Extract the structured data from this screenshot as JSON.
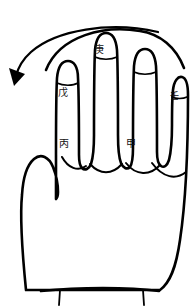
{
  "figure": {
    "background_color": "#ffffff",
    "line_color": "#000000",
    "text_color": "#111111",
    "orientation": "back of left hand, fingers up"
  },
  "labels": {
    "index_finger": "戊",
    "middle_finger": "庚",
    "pinky_finger": "壬",
    "palm_index_base": "丙",
    "palm_ring_base": "甲"
  },
  "annotations": {
    "arrow": {
      "name": "counterclockwise-direction-arrow",
      "direction": "right-to-left curving down, arrowhead at lower-left"
    }
  },
  "parts": {
    "thumb": "thumb",
    "index": "index-finger",
    "middle": "middle-finger",
    "ring": "ring-finger",
    "pinky": "pinky-finger",
    "palm": "palm",
    "wrist": "wrist"
  }
}
